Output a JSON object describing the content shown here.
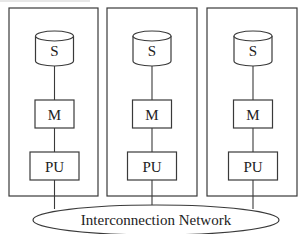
{
  "diagram": {
    "type": "shared-nothing architecture",
    "stroke_color": "#3a3a3a",
    "background": "#ffffff",
    "nodes": [
      {
        "storage_label": "S",
        "memory_label": "M",
        "processor_label": "PU"
      },
      {
        "storage_label": "S",
        "memory_label": "M",
        "processor_label": "PU"
      },
      {
        "storage_label": "S",
        "memory_label": "M",
        "processor_label": "PU"
      }
    ],
    "network": {
      "label": "Interconnection Network"
    }
  }
}
